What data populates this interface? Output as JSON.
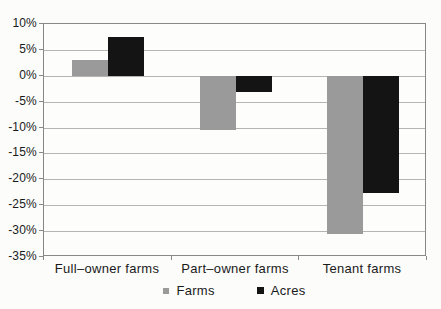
{
  "chart_data": {
    "type": "bar",
    "categories": [
      "Full–owner farms",
      "Part–owner farms",
      "Tenant farms"
    ],
    "series": [
      {
        "name": "Farms",
        "color": "#9a9a9a",
        "values": [
          3,
          -10.5,
          -30.5
        ]
      },
      {
        "name": "Acres",
        "color": "#141414",
        "values": [
          7.5,
          -3,
          -22.5
        ]
      }
    ],
    "ylim": [
      -35,
      10
    ],
    "ytick_step": 5,
    "ytick_labels": [
      "10%",
      "5%",
      "0%",
      "-5%",
      "-10%",
      "-15%",
      "-20%",
      "-25%",
      "-30%",
      "-35%"
    ],
    "grid": true,
    "legend_position": "bottom"
  },
  "colors": {
    "grid": "#b5b5b5",
    "plot_border": "#888888",
    "text": "#1a1a1a",
    "background": "#fcfcfa"
  }
}
